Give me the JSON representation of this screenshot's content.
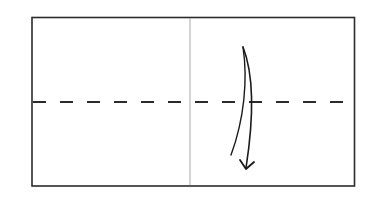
{
  "diagram": {
    "type": "origami-fold-step",
    "paper": {
      "x": 32,
      "y": 17,
      "width": 323,
      "height": 169,
      "stroke": "#2b2b2b"
    },
    "center_crease": {
      "x": 190,
      "stroke": "#a8a8a8",
      "style": "thin-solid"
    },
    "valley_fold_line": {
      "y": 102,
      "stroke": "#2b2b2b",
      "style": "dashed",
      "dash": 13,
      "gap": 14
    },
    "fold_arrow": {
      "direction": "down",
      "meaning": "fold top half down along dashed line",
      "stroke": "#1a1a1a"
    }
  }
}
